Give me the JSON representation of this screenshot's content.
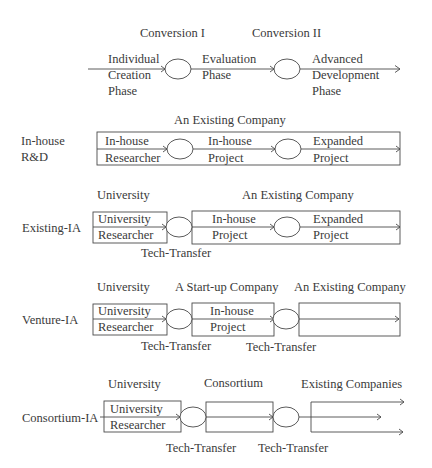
{
  "diagram": {
    "type": "process-flow",
    "colors": {
      "stroke": "#4a4a4a",
      "text": "#3a3a3a",
      "background": "#ffffff"
    },
    "top": {
      "conversion_1": "Conversion I",
      "conversion_2": "Conversion II",
      "phase_1": [
        "Individual",
        "Creation",
        "Phase"
      ],
      "phase_2": [
        "Evaluation",
        "Phase"
      ],
      "phase_3": [
        "Advanced",
        "Development",
        "Phase"
      ]
    },
    "inhouse": {
      "label": [
        "In-house",
        "R&D"
      ],
      "org": "An Existing Company",
      "cells": [
        [
          "In-house",
          "Researcher"
        ],
        [
          "In-house",
          "Project"
        ],
        [
          "Expanded",
          "Project"
        ]
      ]
    },
    "existing": {
      "label": "Existing-IA",
      "org_1": "University",
      "org_2": "An Existing Company",
      "cells": [
        [
          "University",
          "Researcher"
        ],
        [
          "In-house",
          "Project"
        ],
        [
          "Expanded",
          "Project"
        ]
      ],
      "transfer": "Tech-Transfer"
    },
    "venture": {
      "label": "Venture-IA",
      "org_1": "University",
      "org_2": "A Start-up Company",
      "org_3": "An Existing Company",
      "cells": [
        [
          "University",
          "Researcher"
        ],
        [
          "In-house",
          "Project"
        ]
      ],
      "transfer_1": "Tech-Transfer",
      "transfer_2": "Tech-Transfer"
    },
    "consortium": {
      "label": "Consortium-IA",
      "org_1": "University",
      "org_2": "Consortium",
      "org_3": "Existing Companies",
      "cells": [
        [
          "University",
          "Researcher"
        ]
      ],
      "transfer_1": "Tech-Transfer",
      "transfer_2": "Tech-Transfer"
    }
  }
}
